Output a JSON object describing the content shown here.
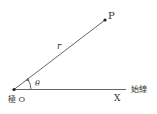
{
  "diagram": {
    "type": "polar-coordinates",
    "labels": {
      "point": "P",
      "radius": "r",
      "angle": "θ",
      "pole": "極 O",
      "axis_end": "X",
      "initial_line": "始線"
    },
    "colors": {
      "line": "#555555",
      "text": "#333333",
      "background": "#ffffff"
    }
  }
}
